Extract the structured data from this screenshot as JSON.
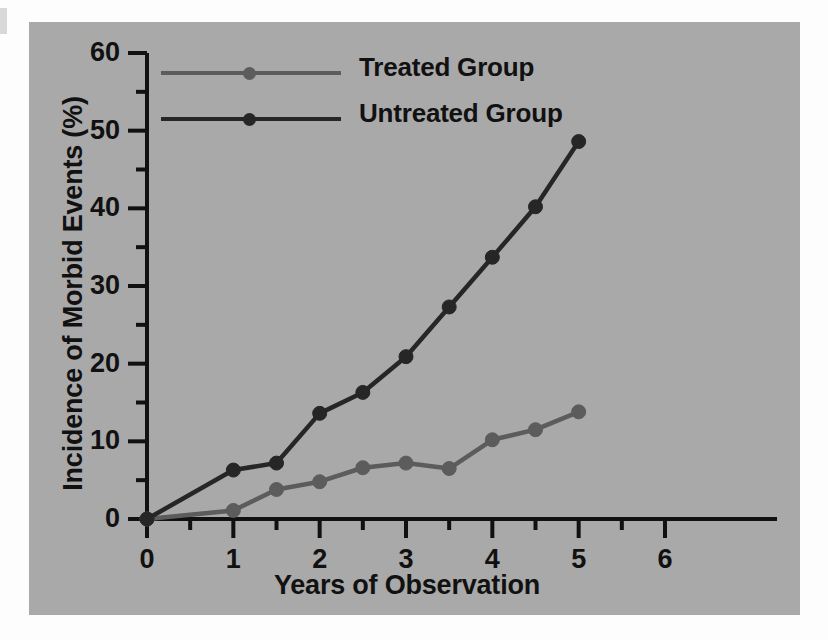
{
  "figure": {
    "background_color": "#a9a9a9",
    "page_color": "#fdfdfd"
  },
  "chart_data": {
    "type": "line",
    "title": "",
    "xlabel": "Years of Observation",
    "ylabel": "Incidence of Morbid Events (%)",
    "xlim": [
      0,
      6
    ],
    "ylim": [
      0,
      60
    ],
    "xticks": [
      0,
      1,
      2,
      3,
      4,
      5,
      6
    ],
    "xtick_labels": [
      "0",
      "1",
      "2",
      "3",
      "4",
      "5",
      "6"
    ],
    "x_minor_ticks": [
      0.5,
      1.5,
      2.5,
      3.5,
      4.5,
      5.5
    ],
    "yticks": [
      0,
      10,
      20,
      30,
      40,
      50,
      60
    ],
    "ytick_labels": [
      "0",
      "10",
      "20",
      "30",
      "40",
      "50",
      "60"
    ],
    "y_minor_ticks": [
      5,
      15,
      25,
      35,
      45,
      55
    ],
    "grid": false,
    "legend_position": "top-left-inside",
    "x": [
      0,
      1,
      1.5,
      2,
      2.5,
      3,
      3.5,
      4,
      4.5,
      5
    ],
    "series": [
      {
        "name": "Treated Group",
        "color": "#5c5c5c",
        "marker": "circle",
        "values": [
          0,
          1.1,
          3.8,
          4.8,
          6.6,
          7.2,
          6.5,
          10.2,
          11.5,
          13.8
        ]
      },
      {
        "name": "Untreated Group",
        "color": "#262626",
        "marker": "circle",
        "values": [
          0,
          6.3,
          7.2,
          13.6,
          16.3,
          20.9,
          27.3,
          33.7,
          40.2,
          48.6
        ]
      }
    ]
  },
  "legend": {
    "items": [
      {
        "label": "Treated Group",
        "color": "#5c5c5c"
      },
      {
        "label": "Untreated Group",
        "color": "#262626"
      }
    ]
  },
  "axes": {
    "y_title": "Incidence of Morbid Events (%)",
    "x_title": "Years of Observation",
    "axis_color": "#111111"
  }
}
